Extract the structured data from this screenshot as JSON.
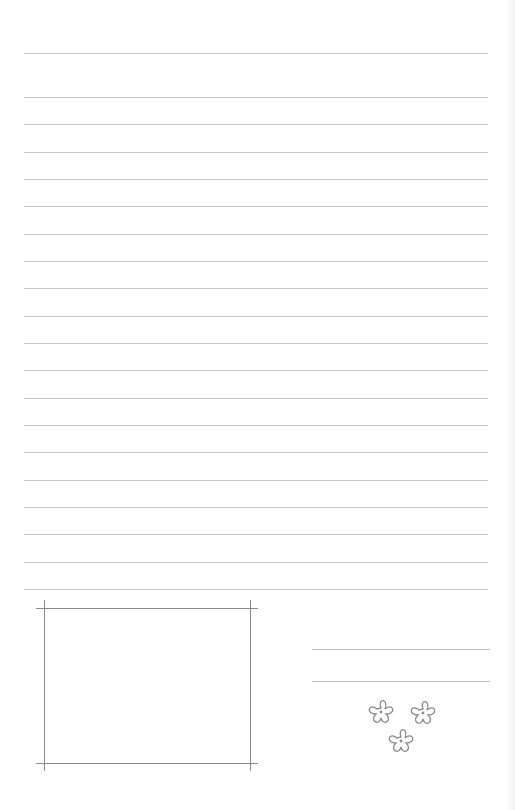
{
  "page": {
    "type": "lined-writing-paper",
    "background": "#ffffff",
    "rule_color": "#c9c9c9",
    "frame_color": "#8a8a8a"
  },
  "rules": {
    "top_line_y": 53,
    "first_y": 97,
    "spacing": 27.33,
    "count": 19,
    "x_start": 24,
    "x_end": 488
  },
  "photo_frame": {
    "left": 44,
    "right": 250,
    "top": 608,
    "bottom": 763,
    "overhang": 8
  },
  "signature_lines": [
    {
      "y": 649,
      "x_start": 312,
      "x_end": 490
    },
    {
      "y": 681,
      "x_start": 312,
      "x_end": 490
    }
  ],
  "decoration": {
    "icon": "flower-icon",
    "count": 3,
    "stroke": "#8a8a8a"
  }
}
